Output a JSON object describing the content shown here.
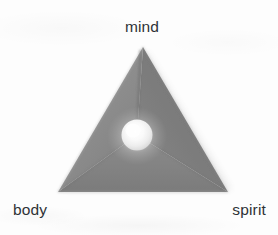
{
  "figure": {
    "shape": "triangle-pyramid",
    "labels": {
      "top": "mind",
      "bottom_left": "body",
      "bottom_right": "spirit"
    },
    "center_element": "glowing-sphere",
    "background_text": "",
    "colors": {
      "background": "#fdfdfd",
      "facet_left": "#8a8a8a",
      "facet_right": "#787878",
      "facet_bottom": "#818181",
      "edge_highlight": "#b6b6b6",
      "seam_shadow": "#6c6c6c",
      "sphere_core": "#ffffff",
      "sphere_rim": "#c9c9c9",
      "label_text": "#2e3236"
    },
    "geometry": {
      "apex": [
        143,
        47
      ],
      "bottom_left": [
        58,
        192
      ],
      "bottom_right": [
        228,
        192
      ],
      "center": [
        137,
        135
      ],
      "sphere_radius": 15.5
    }
  }
}
